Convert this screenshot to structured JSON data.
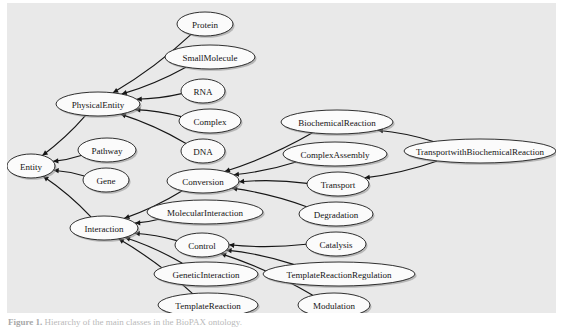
{
  "figure": {
    "caption_label": "Figure 1.",
    "caption_text": "Hierarchy of the main classes in the BioPAX ontology.",
    "panel_background": "#e9e9e9",
    "node_fill": "#fbfbfb",
    "node_stroke": "#1a1a1a",
    "edge_color": "#161616"
  },
  "graph_data": {
    "type": "diagram",
    "layout": "left-to-right class hierarchy",
    "node_count": 22,
    "edge_count": 21,
    "nodes": [
      {
        "id": "Entity",
        "label": "Entity",
        "cx": 24,
        "cy": 163,
        "rx": 24,
        "ry": 12,
        "font_size": 9
      },
      {
        "id": "PhysicalEntity",
        "label": "PhysicalEntity",
        "cx": 91,
        "cy": 101,
        "rx": 42,
        "ry": 12,
        "font_size": 9
      },
      {
        "id": "Pathway",
        "label": "Pathway",
        "cx": 100,
        "cy": 147,
        "rx": 29,
        "ry": 12,
        "font_size": 9
      },
      {
        "id": "Gene",
        "label": "Gene",
        "cx": 99,
        "cy": 177,
        "rx": 23,
        "ry": 12,
        "font_size": 9
      },
      {
        "id": "Interaction",
        "label": "Interaction",
        "cx": 97,
        "cy": 225,
        "rx": 34,
        "ry": 12,
        "font_size": 9
      },
      {
        "id": "Protein",
        "label": "Protein",
        "cx": 198,
        "cy": 21,
        "rx": 28,
        "ry": 12,
        "font_size": 9
      },
      {
        "id": "SmallMolecule",
        "label": "SmallMolecule",
        "cx": 203,
        "cy": 54,
        "rx": 45,
        "ry": 12,
        "font_size": 9
      },
      {
        "id": "RNA",
        "label": "RNA",
        "cx": 196,
        "cy": 88,
        "rx": 22,
        "ry": 12,
        "font_size": 9
      },
      {
        "id": "Complex",
        "label": "Complex",
        "cx": 203,
        "cy": 118,
        "rx": 31,
        "ry": 12,
        "font_size": 9
      },
      {
        "id": "DNA",
        "label": "DNA",
        "cx": 196,
        "cy": 148,
        "rx": 22,
        "ry": 12,
        "font_size": 9
      },
      {
        "id": "Conversion",
        "label": "Conversion",
        "cx": 196,
        "cy": 178,
        "rx": 36,
        "ry": 12,
        "font_size": 9
      },
      {
        "id": "MolecularInteraction",
        "label": "MolecularInteraction",
        "cx": 198,
        "cy": 209,
        "rx": 58,
        "ry": 12,
        "font_size": 9
      },
      {
        "id": "Control",
        "label": "Control",
        "cx": 195,
        "cy": 242,
        "rx": 27,
        "ry": 12,
        "font_size": 9
      },
      {
        "id": "GeneticInteraction",
        "label": "GeneticInteraction",
        "cx": 199,
        "cy": 271,
        "rx": 52,
        "ry": 12,
        "font_size": 9
      },
      {
        "id": "TemplateReaction",
        "label": "TemplateReaction",
        "cx": 201,
        "cy": 302,
        "rx": 50,
        "ry": 12,
        "font_size": 9
      },
      {
        "id": "BiochemicalReaction",
        "label": "BiochemicalReaction",
        "cx": 330,
        "cy": 119,
        "rx": 56,
        "ry": 12,
        "font_size": 9
      },
      {
        "id": "ComplexAssembly",
        "label": "ComplexAssembly",
        "cx": 328,
        "cy": 151,
        "rx": 52,
        "ry": 12,
        "font_size": 9
      },
      {
        "id": "Transport",
        "label": "Transport",
        "cx": 331,
        "cy": 181,
        "rx": 31,
        "ry": 12,
        "font_size": 9
      },
      {
        "id": "Degradation",
        "label": "Degradation",
        "cx": 329,
        "cy": 211,
        "rx": 37,
        "ry": 12,
        "font_size": 9
      },
      {
        "id": "Catalysis",
        "label": "Catalysis",
        "cx": 329,
        "cy": 241,
        "rx": 30,
        "ry": 12,
        "font_size": 9
      },
      {
        "id": "TemplateReactionRegulation",
        "label": "TemplateReactionRegulation",
        "cx": 332,
        "cy": 271,
        "rx": 76,
        "ry": 12,
        "font_size": 9
      },
      {
        "id": "Modulation",
        "label": "Modulation",
        "cx": 327,
        "cy": 302,
        "rx": 36,
        "ry": 12,
        "font_size": 9
      },
      {
        "id": "TransportwithBiochemicalReaction",
        "label": "TransportwithBiochemicalReaction",
        "cx": 473,
        "cy": 148,
        "rx": 76,
        "ry": 12,
        "font_size": 9
      }
    ],
    "edges": [
      {
        "from": "PhysicalEntity",
        "to": "Entity",
        "arrow_at": "Entity"
      },
      {
        "from": "Pathway",
        "to": "Entity",
        "arrow_at": "Entity"
      },
      {
        "from": "Gene",
        "to": "Entity",
        "arrow_at": "Entity"
      },
      {
        "from": "Interaction",
        "to": "Entity",
        "arrow_at": "Entity"
      },
      {
        "from": "Protein",
        "to": "PhysicalEntity",
        "arrow_at": "PhysicalEntity"
      },
      {
        "from": "SmallMolecule",
        "to": "PhysicalEntity",
        "arrow_at": "PhysicalEntity"
      },
      {
        "from": "RNA",
        "to": "PhysicalEntity",
        "arrow_at": "PhysicalEntity"
      },
      {
        "from": "Complex",
        "to": "PhysicalEntity",
        "arrow_at": "PhysicalEntity"
      },
      {
        "from": "DNA",
        "to": "PhysicalEntity",
        "arrow_at": "PhysicalEntity"
      },
      {
        "from": "Conversion",
        "to": "Interaction",
        "arrow_at": "Interaction"
      },
      {
        "from": "MolecularInteraction",
        "to": "Interaction",
        "arrow_at": "Interaction"
      },
      {
        "from": "Control",
        "to": "Interaction",
        "arrow_at": "Interaction"
      },
      {
        "from": "GeneticInteraction",
        "to": "Interaction",
        "arrow_at": "Interaction"
      },
      {
        "from": "TemplateReaction",
        "to": "Interaction",
        "arrow_at": "Interaction"
      },
      {
        "from": "BiochemicalReaction",
        "to": "Conversion",
        "arrow_at": "Conversion"
      },
      {
        "from": "ComplexAssembly",
        "to": "Conversion",
        "arrow_at": "Conversion"
      },
      {
        "from": "Transport",
        "to": "Conversion",
        "arrow_at": "Conversion"
      },
      {
        "from": "Degradation",
        "to": "Conversion",
        "arrow_at": "Conversion"
      },
      {
        "from": "Catalysis",
        "to": "Control",
        "arrow_at": "Control"
      },
      {
        "from": "TemplateReactionRegulation",
        "to": "Control",
        "arrow_at": "Control"
      },
      {
        "from": "Modulation",
        "to": "Control",
        "arrow_at": "Control"
      },
      {
        "from": "TransportwithBiochemicalReaction",
        "to": "BiochemicalReaction",
        "arrow_at": "BiochemicalReaction"
      },
      {
        "from": "TransportwithBiochemicalReaction",
        "to": "Transport",
        "arrow_at": "Transport"
      }
    ]
  }
}
